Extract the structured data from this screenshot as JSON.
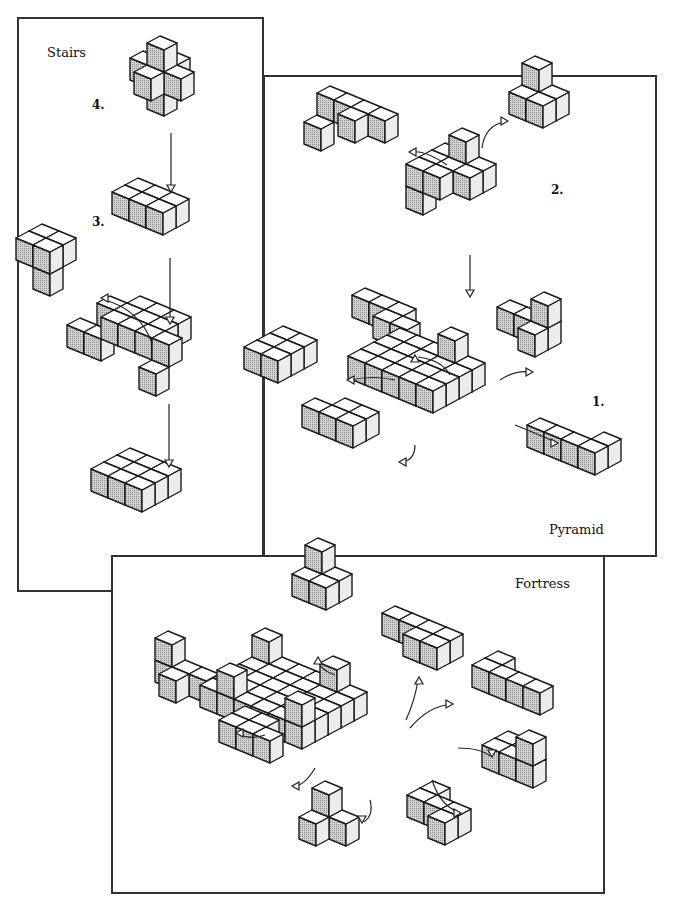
{
  "colors": {
    "top": "#ffffff",
    "left": "#bdbdbd",
    "right": "#ececec",
    "stroke": "#1a1a1a",
    "frame": "#333333"
  },
  "panels": {
    "stairs": {
      "title": "Stairs",
      "steps": [
        "4.",
        "3.",
        "2.",
        "1."
      ]
    },
    "pyramid": {
      "title": "Pyramid",
      "steps": [
        "2.",
        "1."
      ]
    },
    "fortress": {
      "title": "Fortress"
    }
  },
  "cube_scale": {
    "ax": [
      17,
      7
    ],
    "bx": [
      -13,
      7
    ],
    "h": 22
  },
  "pieces": [
    {
      "name": "stairs-step4-piece",
      "o": [
        160,
        58
      ],
      "s": 1,
      "cubes": [
        [
          0,
          0,
          0
        ],
        [
          1,
          0,
          -1
        ],
        [
          0,
          1,
          -1
        ],
        [
          -1,
          0,
          -1
        ],
        [
          0,
          -1,
          -1
        ],
        [
          0,
          0,
          -2
        ]
      ]
    },
    {
      "name": "stairs-step3-piece",
      "o": [
        138,
        200
      ],
      "s": 1,
      "cubes": [
        [
          0,
          0,
          0
        ],
        [
          1,
          0,
          0
        ],
        [
          2,
          0,
          0
        ],
        [
          0,
          1,
          0
        ],
        [
          1,
          1,
          0
        ],
        [
          2,
          1,
          0
        ]
      ]
    },
    {
      "name": "stairs-step2-removed-piece",
      "o": [
        42,
        268
      ],
      "s": 1,
      "cubes": [
        [
          0,
          0,
          1
        ],
        [
          1,
          0,
          1
        ],
        [
          0,
          1,
          1
        ],
        [
          1,
          1,
          1
        ],
        [
          1,
          1,
          0
        ]
      ]
    },
    {
      "name": "stairs-step2-base",
      "o": [
        140,
        318
      ],
      "s": 1,
      "cubes": [
        [
          0,
          0,
          0
        ],
        [
          1,
          0,
          0
        ],
        [
          2,
          0,
          0
        ],
        [
          0,
          1,
          0
        ],
        [
          1,
          1,
          0
        ],
        [
          2,
          1,
          0
        ],
        [
          0,
          2,
          0
        ],
        [
          1,
          2,
          0
        ],
        [
          2,
          2,
          0
        ],
        [
          3,
          2,
          0
        ],
        [
          -1,
          1,
          0
        ],
        [
          -1,
          2,
          -1
        ],
        [
          3,
          3,
          -1
        ],
        [
          -2,
          2,
          -1
        ]
      ]
    },
    {
      "name": "stairs-step1-base",
      "o": [
        130,
        470
      ],
      "s": 1,
      "cubes": [
        [
          0,
          0,
          0
        ],
        [
          1,
          0,
          0
        ],
        [
          2,
          0,
          0
        ],
        [
          0,
          1,
          0
        ],
        [
          1,
          1,
          0
        ],
        [
          2,
          1,
          0
        ],
        [
          0,
          2,
          0
        ],
        [
          1,
          2,
          0
        ],
        [
          2,
          2,
          0
        ]
      ]
    },
    {
      "name": "pyramid-step2-piece-left",
      "o": [
        330,
        108
      ],
      "s": 1,
      "cubes": [
        [
          0,
          0,
          0
        ],
        [
          1,
          0,
          0
        ],
        [
          2,
          0,
          0
        ],
        [
          2,
          1,
          0
        ],
        [
          0,
          1,
          -1
        ],
        [
          3,
          0,
          0
        ]
      ]
    },
    {
      "name": "pyramid-step2-piece-right",
      "o": [
        535,
        100
      ],
      "s": 1,
      "cubes": [
        [
          0,
          0,
          0
        ],
        [
          1,
          0,
          0
        ],
        [
          0,
          1,
          0
        ],
        [
          1,
          1,
          0
        ],
        [
          0,
          0,
          1
        ]
      ]
    },
    {
      "name": "pyramid-step2-assembly",
      "o": [
        445,
        165
      ],
      "s": 1,
      "cubes": [
        [
          0,
          0,
          0
        ],
        [
          1,
          0,
          0
        ],
        [
          2,
          0,
          0
        ],
        [
          0,
          1,
          0
        ],
        [
          1,
          1,
          0
        ],
        [
          2,
          1,
          0
        ],
        [
          0,
          2,
          0
        ],
        [
          1,
          2,
          0
        ],
        [
          1,
          0,
          1
        ],
        [
          0,
          2,
          -1
        ]
      ]
    },
    {
      "name": "pyramid-step1-piece-top",
      "o": [
        365,
        310
      ],
      "s": 1,
      "cubes": [
        [
          0,
          0,
          0
        ],
        [
          1,
          0,
          0
        ],
        [
          2,
          0,
          0
        ],
        [
          2,
          1,
          0
        ],
        [
          3,
          1,
          0
        ]
      ]
    },
    {
      "name": "pyramid-step1-piece-left",
      "o": [
        283,
        348
      ],
      "s": 1,
      "cubes": [
        [
          0,
          0,
          0
        ],
        [
          1,
          0,
          0
        ],
        [
          0,
          1,
          0
        ],
        [
          1,
          1,
          0
        ],
        [
          0,
          2,
          0
        ],
        [
          1,
          2,
          0
        ]
      ]
    },
    {
      "name": "pyramid-step1-piece-right",
      "o": [
        510,
        322
      ],
      "s": 1,
      "cubes": [
        [
          0,
          0,
          0
        ],
        [
          1,
          0,
          0
        ],
        [
          2,
          0,
          0
        ],
        [
          2,
          0,
          1
        ],
        [
          2,
          1,
          0
        ]
      ]
    },
    {
      "name": "pyramid-step1-base",
      "o": [
        400,
        350
      ],
      "s": 1,
      "cubes": [
        [
          0,
          0,
          0
        ],
        [
          1,
          0,
          0
        ],
        [
          2,
          0,
          0
        ],
        [
          3,
          0,
          0
        ],
        [
          4,
          0,
          0
        ],
        [
          0,
          1,
          0
        ],
        [
          1,
          1,
          0
        ],
        [
          2,
          1,
          0
        ],
        [
          3,
          1,
          0
        ],
        [
          4,
          1,
          0
        ],
        [
          0,
          2,
          0
        ],
        [
          1,
          2,
          0
        ],
        [
          2,
          2,
          0
        ],
        [
          3,
          2,
          0
        ],
        [
          4,
          2,
          0
        ],
        [
          0,
          3,
          0
        ],
        [
          1,
          3,
          0
        ],
        [
          2,
          3,
          0
        ],
        [
          3,
          3,
          0
        ],
        [
          4,
          3,
          0
        ],
        [
          3,
          0,
          1
        ]
      ]
    },
    {
      "name": "pyramid-step1-piece-bottomleft",
      "o": [
        345,
        420
      ],
      "s": 1,
      "cubes": [
        [
          0,
          0,
          0
        ],
        [
          1,
          0,
          0
        ],
        [
          0,
          1,
          0
        ],
        [
          1,
          1,
          0
        ],
        [
          -1,
          1,
          0
        ]
      ]
    },
    {
      "name": "pyramid-step1-piece-bottomright",
      "o": [
        540,
        440
      ],
      "s": 1,
      "cubes": [
        [
          0,
          0,
          0
        ],
        [
          1,
          0,
          0
        ],
        [
          2,
          0,
          0
        ],
        [
          3,
          0,
          0
        ],
        [
          3,
          -1,
          0
        ]
      ]
    },
    {
      "name": "fortress-piece-top",
      "o": [
        318,
        582
      ],
      "s": 1,
      "cubes": [
        [
          0,
          0,
          0
        ],
        [
          1,
          0,
          0
        ],
        [
          0,
          1,
          0
        ],
        [
          1,
          1,
          0
        ],
        [
          0,
          0,
          1
        ]
      ]
    },
    {
      "name": "fortress-piece-topright",
      "o": [
        395,
        628
      ],
      "s": 1,
      "cubes": [
        [
          0,
          0,
          0
        ],
        [
          1,
          0,
          0
        ],
        [
          2,
          0,
          0
        ],
        [
          3,
          0,
          0
        ],
        [
          2,
          1,
          0
        ],
        [
          3,
          1,
          0
        ]
      ]
    },
    {
      "name": "fortress-piece-left",
      "o": [
        168,
        675
      ],
      "s": 1,
      "cubes": [
        [
          0,
          0,
          0
        ],
        [
          0,
          0,
          1
        ],
        [
          1,
          0,
          0
        ],
        [
          2,
          0,
          0
        ],
        [
          1,
          1,
          0
        ]
      ]
    },
    {
      "name": "fortress-piece-right",
      "o": [
        485,
        680
      ],
      "s": 1,
      "cubes": [
        [
          0,
          0,
          0
        ],
        [
          1,
          0,
          0
        ],
        [
          2,
          0,
          0
        ],
        [
          3,
          0,
          0
        ],
        [
          0,
          -1,
          0
        ]
      ]
    },
    {
      "name": "fortress-base",
      "o": [
        265,
        672
      ],
      "s": 1,
      "cubes": [
        [
          0,
          0,
          0
        ],
        [
          1,
          0,
          0
        ],
        [
          2,
          0,
          0
        ],
        [
          3,
          0,
          0
        ],
        [
          4,
          0,
          0
        ],
        [
          5,
          0,
          0
        ],
        [
          0,
          1,
          0
        ],
        [
          1,
          1,
          0
        ],
        [
          2,
          1,
          0
        ],
        [
          3,
          1,
          0
        ],
        [
          4,
          1,
          0
        ],
        [
          5,
          1,
          0
        ],
        [
          0,
          2,
          0
        ],
        [
          1,
          2,
          0
        ],
        [
          2,
          2,
          0
        ],
        [
          3,
          2,
          0
        ],
        [
          4,
          2,
          0
        ],
        [
          5,
          2,
          0
        ],
        [
          0,
          3,
          0
        ],
        [
          1,
          3,
          0
        ],
        [
          2,
          3,
          0
        ],
        [
          3,
          3,
          0
        ],
        [
          4,
          3,
          0
        ],
        [
          5,
          3,
          0
        ],
        [
          0,
          4,
          0
        ],
        [
          1,
          4,
          0
        ],
        [
          2,
          4,
          0
        ],
        [
          3,
          4,
          0
        ],
        [
          4,
          4,
          0
        ],
        [
          5,
          4,
          0
        ],
        [
          0,
          0,
          1
        ],
        [
          4,
          0,
          1
        ],
        [
          5,
          4,
          1
        ],
        [
          1,
          4,
          1
        ]
      ]
    },
    {
      "name": "fortress-piece-midleft",
      "o": [
        245,
        728
      ],
      "s": 1,
      "cubes": [
        [
          0,
          0,
          0
        ],
        [
          1,
          0,
          0
        ],
        [
          0,
          1,
          0
        ],
        [
          1,
          1,
          0
        ],
        [
          2,
          1,
          0
        ]
      ]
    },
    {
      "name": "fortress-piece-midright",
      "o": [
        495,
        760
      ],
      "s": 1,
      "cubes": [
        [
          0,
          0,
          0
        ],
        [
          1,
          0,
          0
        ],
        [
          2,
          0,
          0
        ],
        [
          2,
          0,
          1
        ],
        [
          0,
          -1,
          0
        ]
      ]
    },
    {
      "name": "fortress-piece-bottom",
      "o": [
        325,
        825
      ],
      "s": 1,
      "cubes": [
        [
          0,
          0,
          0
        ],
        [
          0,
          1,
          0
        ],
        [
          1,
          0,
          0
        ],
        [
          0,
          0,
          1
        ]
      ]
    },
    {
      "name": "fortress-piece-bottomright",
      "o": [
        420,
        810
      ],
      "s": 1,
      "cubes": [
        [
          0,
          0,
          0
        ],
        [
          1,
          0,
          0
        ],
        [
          2,
          0,
          0
        ],
        [
          0,
          -1,
          0
        ],
        [
          2,
          1,
          0
        ]
      ]
    }
  ],
  "arrows": [
    {
      "name": "stairs-arrow-4-to-3",
      "d": "M171 133 L171 190",
      "head": [
        171,
        192,
        "down"
      ]
    },
    {
      "name": "stairs-arrow-3-to-2",
      "d": "M170 258 L170 322",
      "head": [
        170,
        324,
        "down"
      ]
    },
    {
      "name": "stairs-arrow-2-remove",
      "d": "M152 343 Q140 310 105 300",
      "head": [
        101,
        298,
        "left"
      ]
    },
    {
      "name": "stairs-arrow-2-to-1",
      "d": "M169 404 L169 465",
      "head": [
        169,
        467,
        "down"
      ]
    },
    {
      "name": "pyramid-arrow-left",
      "d": "M447 165 Q425 150 412 152",
      "head": [
        409,
        152,
        "left"
      ]
    },
    {
      "name": "pyramid-arrow-right",
      "d": "M482 148 Q485 125 505 122",
      "head": [
        508,
        121,
        "right"
      ]
    },
    {
      "name": "pyramid-arrow-down",
      "d": "M470 255 L470 293",
      "head": [
        470,
        297,
        "down"
      ]
    },
    {
      "name": "pyramid-arrow-top",
      "d": "M450 375 Q442 360 418 357",
      "head": [
        415,
        355,
        "up"
      ]
    },
    {
      "name": "pyramid-arrow-left1",
      "d": "M395 380 Q375 375 350 380",
      "head": [
        347,
        380,
        "left"
      ]
    },
    {
      "name": "pyramid-arrow-right1",
      "d": "M500 380 Q515 370 530 372",
      "head": [
        533,
        372,
        "right"
      ]
    },
    {
      "name": "pyramid-arrow-bl",
      "d": "M415 445 Q415 460 402 462",
      "head": [
        399,
        462,
        "left"
      ]
    },
    {
      "name": "pyramid-arrow-br",
      "d": "M515 425 Q540 435 555 442",
      "head": [
        558,
        443,
        "right"
      ]
    },
    {
      "name": "fortress-arrow-top",
      "d": "M335 675 Q320 670 318 660",
      "head": [
        318,
        657,
        "up"
      ]
    },
    {
      "name": "fortress-arrow-tr",
      "d": "M406 720 Q415 700 418 680",
      "head": [
        419,
        677,
        "up"
      ]
    },
    {
      "name": "fortress-arrow-r",
      "d": "M410 728 Q430 705 450 705",
      "head": [
        453,
        704,
        "right"
      ]
    },
    {
      "name": "fortress-arrow-l",
      "d": "M265 735 Q250 740 238 734",
      "head": [
        236,
        733,
        "left"
      ]
    },
    {
      "name": "fortress-arrow-ml",
      "d": "M315 768 Q305 785 295 786",
      "head": [
        292,
        786,
        "left"
      ]
    },
    {
      "name": "fortress-arrow-mr",
      "d": "M458 748 Q480 748 490 756",
      "head": [
        492,
        757,
        "down"
      ]
    },
    {
      "name": "fortress-arrow-b",
      "d": "M370 800 Q374 815 364 822",
      "head": [
        362,
        823,
        "down"
      ]
    },
    {
      "name": "fortress-arrow-br",
      "d": "M432 780 Q440 805 458 812",
      "head": [
        461,
        813,
        "right"
      ]
    }
  ]
}
